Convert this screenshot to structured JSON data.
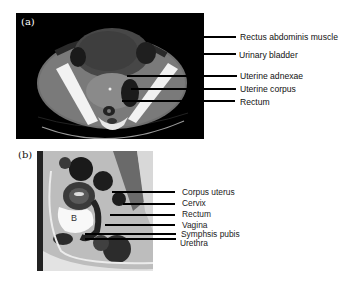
{
  "figure": {
    "panels": [
      {
        "id": "a",
        "label": "(a)",
        "modality": "axial CT pelvis",
        "callouts": [
          {
            "text": "Rectus abdominis muscle"
          },
          {
            "text": "Urinary bladder"
          },
          {
            "text": "Uterine adnexae"
          },
          {
            "text": "Uterine corpus"
          },
          {
            "text": "Rectum"
          }
        ]
      },
      {
        "id": "b",
        "label": "(b)",
        "modality": "sagittal MRI pelvis",
        "inline_marker": "B",
        "callouts": [
          {
            "text": "Corpus uterus"
          },
          {
            "text": "Cervix"
          },
          {
            "text": "Rectum"
          },
          {
            "text": "Vagina"
          },
          {
            "text": "Symphsis pubis"
          },
          {
            "text": "Urethra"
          }
        ]
      }
    ]
  },
  "colors": {
    "background": "#ffffff",
    "ct_background": "#000000",
    "leader_line": "#000000",
    "text": "#111111"
  }
}
